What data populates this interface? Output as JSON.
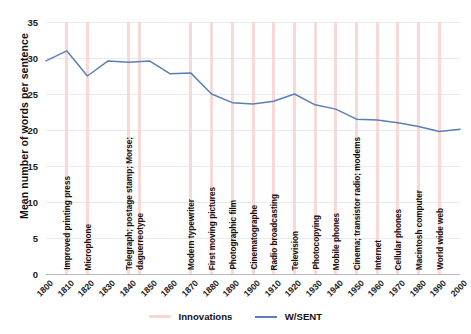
{
  "axes": {
    "ylabel": "Mean number of words per sentence",
    "yticks": [
      "0",
      "5",
      "10",
      "15",
      "20",
      "25",
      "30",
      "35"
    ],
    "ylim": [
      0,
      35
    ],
    "xticks": [
      "1800",
      "1810",
      "1820",
      "1830",
      "1840",
      "1850",
      "1860",
      "1870",
      "1880",
      "1890",
      "1900",
      "1910",
      "1920",
      "1930",
      "1940",
      "1950",
      "1960",
      "1970",
      "1980",
      "1990",
      "2000"
    ],
    "xlim": [
      1800,
      2000
    ]
  },
  "legend": {
    "innovations_label": "Innovations",
    "wsent_label": "W/SENT",
    "innovations_color": "#f8d7d3",
    "wsent_color": "#5b7fb5"
  },
  "chart_data": {
    "type": "line",
    "title": "",
    "xlabel": "",
    "ylabel": "Mean number of words per sentence",
    "ylim": [
      0,
      35
    ],
    "grid": true,
    "legend_position": "bottom",
    "x": [
      1800,
      1810,
      1820,
      1830,
      1840,
      1850,
      1860,
      1870,
      1880,
      1890,
      1900,
      1910,
      1920,
      1930,
      1940,
      1950,
      1960,
      1970,
      1980,
      1990,
      2000
    ],
    "series": [
      {
        "name": "W/SENT",
        "color": "#5b7fb5",
        "values": [
          29.6,
          31.0,
          27.5,
          29.6,
          29.4,
          29.6,
          27.8,
          27.9,
          25.0,
          23.8,
          23.6,
          24.0,
          25.0,
          23.5,
          22.9,
          21.5,
          21.4,
          21.0,
          20.5,
          19.8,
          20.1
        ]
      }
    ],
    "annotations": {
      "type": "vertical-bands",
      "label": "Innovations",
      "color": "#f8d7d3",
      "items": [
        {
          "year": 1810,
          "label": "Improved printing press"
        },
        {
          "year": 1820,
          "label": "Microphone"
        },
        {
          "year": 1840,
          "label": "Telegraph; postage stamp; Morse;"
        },
        {
          "year": 1845,
          "label": "daguerreotype"
        },
        {
          "year": 1870,
          "label": "Modern typewriter"
        },
        {
          "year": 1880,
          "label": "First moving pictures"
        },
        {
          "year": 1890,
          "label": "Photographic film"
        },
        {
          "year": 1900,
          "label": "Cinematographe"
        },
        {
          "year": 1910,
          "label": "Radio broadcasting"
        },
        {
          "year": 1920,
          "label": "Television"
        },
        {
          "year": 1930,
          "label": "Photocopying"
        },
        {
          "year": 1940,
          "label": "Mobile phones"
        },
        {
          "year": 1950,
          "label": "Cinema; transistor radio; modems"
        },
        {
          "year": 1960,
          "label": "Internet"
        },
        {
          "year": 1970,
          "label": "Cellular phones"
        },
        {
          "year": 1980,
          "label": "Macintosh computer"
        },
        {
          "year": 1990,
          "label": "World wide web"
        }
      ]
    }
  }
}
